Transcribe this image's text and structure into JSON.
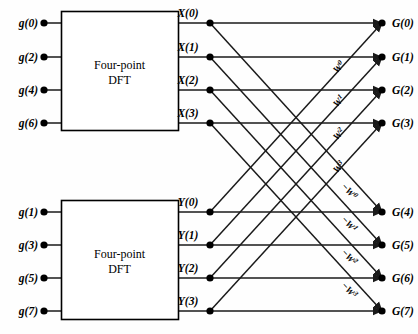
{
  "diagram": {
    "colors": {
      "line": "#1a1a1a",
      "node": "#000000",
      "box_stroke": "#000000",
      "background": "#fefefe",
      "text": "#000000"
    },
    "blocks": [
      {
        "id": "dft-top",
        "label_line1": "Four-point",
        "label_line2": "DFT",
        "x": 61,
        "y": 11,
        "w": 117,
        "h": 119
      },
      {
        "id": "dft-bottom",
        "label_line1": "Four-point",
        "label_line2": "DFT",
        "x": 61,
        "y": 200,
        "w": 117,
        "h": 119
      }
    ],
    "inputs": [
      {
        "label": "g(0)",
        "y": 23,
        "block": "dft-top"
      },
      {
        "label": "g(2)",
        "y": 57,
        "block": "dft-top"
      },
      {
        "label": "g(4)",
        "y": 90,
        "block": "dft-top"
      },
      {
        "label": "g(6)",
        "y": 123,
        "block": "dft-top"
      },
      {
        "label": "g(1)",
        "y": 212,
        "block": "dft-bottom"
      },
      {
        "label": "g(3)",
        "y": 245,
        "block": "dft-bottom"
      },
      {
        "label": "g(5)",
        "y": 278,
        "block": "dft-bottom"
      },
      {
        "label": "g(7)",
        "y": 311,
        "block": "dft-bottom"
      }
    ],
    "intermediates": [
      {
        "label": "X(0)",
        "y": 23,
        "node_x": 210
      },
      {
        "label": "X(1)",
        "y": 57,
        "node_x": 210
      },
      {
        "label": "X(2)",
        "y": 90,
        "node_x": 210
      },
      {
        "label": "X(3)",
        "y": 123,
        "node_x": 210
      },
      {
        "label": "Y(0)",
        "y": 212,
        "node_x": 210
      },
      {
        "label": "Y(1)",
        "y": 245,
        "node_x": 210
      },
      {
        "label": "Y(2)",
        "y": 278,
        "node_x": 210
      },
      {
        "label": "Y(3)",
        "y": 311,
        "node_x": 210
      }
    ],
    "outputs": [
      {
        "label": "G(0)",
        "y": 23,
        "node_x": 382
      },
      {
        "label": "G(1)",
        "y": 57,
        "node_x": 382
      },
      {
        "label": "G(2)",
        "y": 90,
        "node_x": 382
      },
      {
        "label": "G(3)",
        "y": 123,
        "node_x": 382
      },
      {
        "label": "G(4)",
        "y": 212,
        "node_x": 382
      },
      {
        "label": "G(5)",
        "y": 245,
        "node_x": 382
      },
      {
        "label": "G(6)",
        "y": 278,
        "node_x": 382
      },
      {
        "label": "G(7)",
        "y": 311,
        "node_x": 382
      }
    ],
    "twiddle_labels_positive": [
      {
        "text": "W",
        "exp": "0",
        "x": 344,
        "y": 72
      },
      {
        "text": "W",
        "exp": "1",
        "x": 344,
        "y": 106
      },
      {
        "text": "W",
        "exp": "2",
        "x": 344,
        "y": 139
      },
      {
        "text": "W",
        "exp": "3",
        "x": 344,
        "y": 172
      }
    ],
    "twiddle_labels_negative": [
      {
        "text": "−W",
        "exp": "0",
        "x": 344,
        "y": 196
      },
      {
        "text": "−W",
        "exp": "1",
        "x": 344,
        "y": 229
      },
      {
        "text": "−W",
        "exp": "2",
        "x": 344,
        "y": 262
      },
      {
        "text": "−W",
        "exp": "3",
        "x": 344,
        "y": 295
      }
    ]
  }
}
